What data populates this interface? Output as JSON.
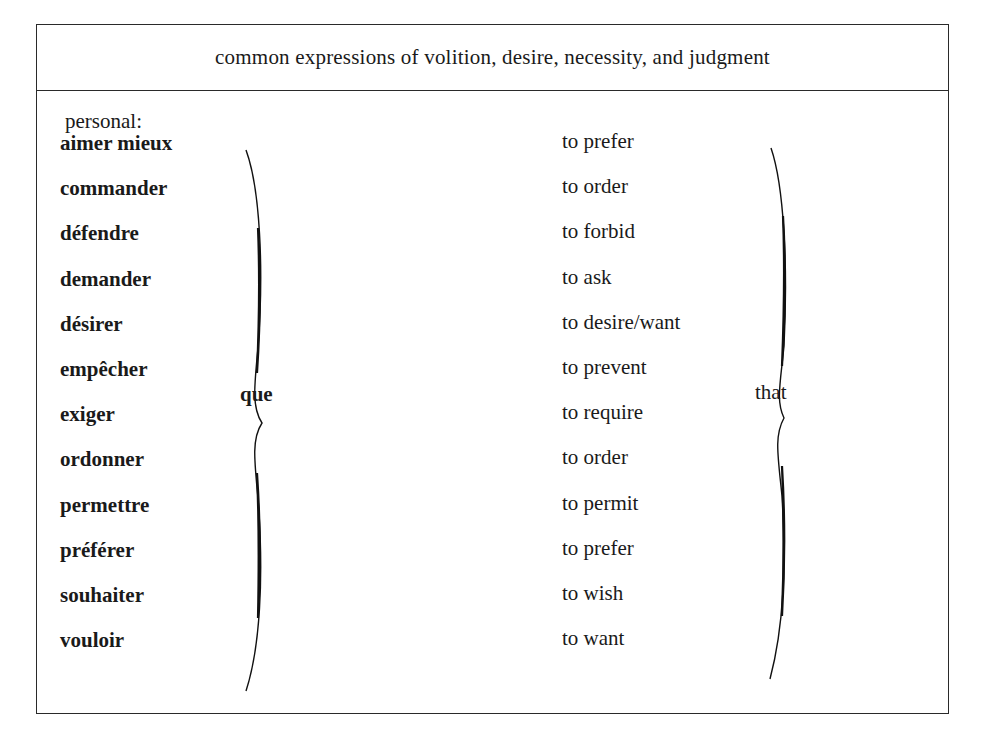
{
  "table": {
    "title": "common expressions of volition, desire, necessity, and judgment",
    "section_label": "personal:",
    "french_connector": "que",
    "english_connector": "that",
    "rows": [
      {
        "french": "aimer mieux",
        "english": "to prefer"
      },
      {
        "french": "commander",
        "english": "to order"
      },
      {
        "french": "défendre",
        "english": "to forbid"
      },
      {
        "french": "demander",
        "english": "to ask"
      },
      {
        "french": "désirer",
        "english": "to desire/want"
      },
      {
        "french": "empêcher",
        "english": "to prevent"
      },
      {
        "french": "exiger",
        "english": "to require"
      },
      {
        "french": "ordonner",
        "english": "to order"
      },
      {
        "french": "permettre",
        "english": "to permit"
      },
      {
        "french": "préférer",
        "english": "to prefer"
      },
      {
        "french": "souhaiter",
        "english": "to wish"
      },
      {
        "french": "vouloir",
        "english": "to want"
      }
    ]
  }
}
